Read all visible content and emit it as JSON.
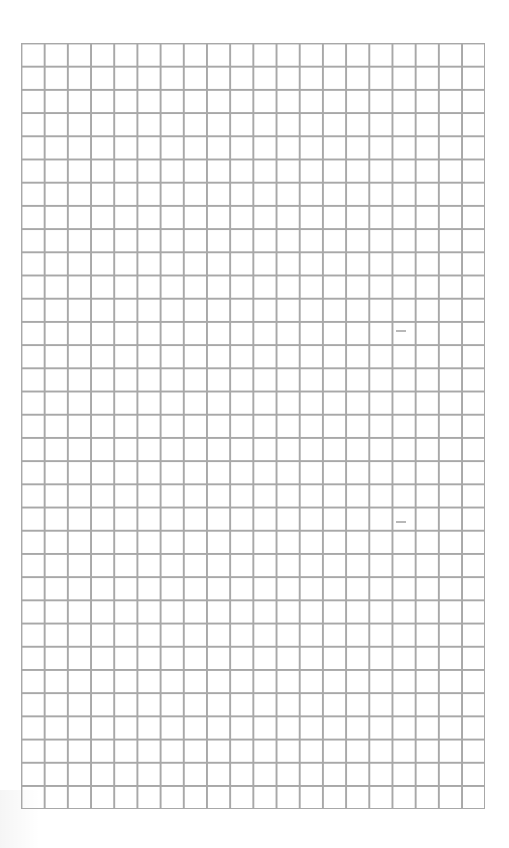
{
  "page": {
    "type": "graph-paper",
    "background_color": "#ffffff"
  },
  "grid": {
    "columns": 20,
    "rows": 33,
    "cell_size_px": 23.2,
    "line_color": "#a8a8a8"
  },
  "marks": [
    {
      "description": "faint dash",
      "x": 396,
      "y": 330,
      "w": 10
    },
    {
      "description": "faint dash",
      "x": 396,
      "y": 521,
      "w": 10
    }
  ]
}
